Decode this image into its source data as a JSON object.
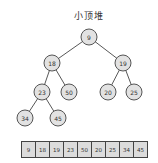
{
  "title": "小顶堆",
  "tree": {
    "nodes": [
      {
        "id": 0,
        "value": "9",
        "cx": 89,
        "cy": 37
      },
      {
        "id": 1,
        "value": "18",
        "cx": 52,
        "cy": 63
      },
      {
        "id": 2,
        "value": "19",
        "cx": 123,
        "cy": 63
      },
      {
        "id": 3,
        "value": "23",
        "cx": 42,
        "cy": 92
      },
      {
        "id": 4,
        "value": "50",
        "cx": 69,
        "cy": 92
      },
      {
        "id": 5,
        "value": "20",
        "cx": 108,
        "cy": 92
      },
      {
        "id": 6,
        "value": "25",
        "cx": 134,
        "cy": 92
      },
      {
        "id": 7,
        "value": "34",
        "cx": 25,
        "cy": 118
      },
      {
        "id": 8,
        "value": "45",
        "cx": 58,
        "cy": 118
      }
    ],
    "edges": [
      [
        0,
        1
      ],
      [
        0,
        2
      ],
      [
        1,
        3
      ],
      [
        1,
        4
      ],
      [
        2,
        5
      ],
      [
        2,
        6
      ],
      [
        3,
        7
      ],
      [
        3,
        8
      ]
    ]
  },
  "array": {
    "values": [
      "9",
      "18",
      "19",
      "23",
      "50",
      "20",
      "25",
      "34",
      "45"
    ]
  }
}
